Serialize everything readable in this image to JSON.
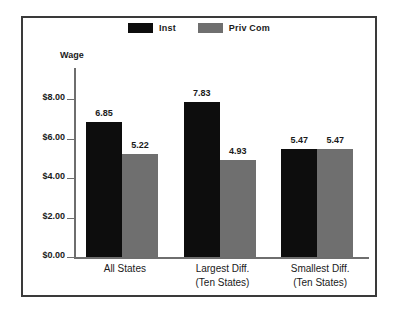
{
  "chart_data": {
    "type": "bar",
    "title": "",
    "xlabel": "",
    "ylabel": "Wage",
    "ylim": [
      0,
      8
    ],
    "grid": false,
    "legend_position": "top-center",
    "categories": [
      {
        "line1": "All States",
        "line2": ""
      },
      {
        "line1": "Largest Diff.",
        "line2": "(Ten States)"
      },
      {
        "line1": "Smallest Diff.",
        "line2": "(Ten States)"
      }
    ],
    "y_ticks": [
      "$0.00",
      "$2.00",
      "$4.00",
      "$6.00",
      "$8.00"
    ],
    "y_tick_values": [
      0,
      2,
      4,
      6,
      8
    ],
    "series": [
      {
        "name": "Inst",
        "color": "#0d0d0d",
        "values": [
          6.85,
          7.83,
          5.47
        ],
        "labels": [
          "6.85",
          "7.83",
          "5.47"
        ]
      },
      {
        "name": "Priv Com",
        "color": "#6f6f6f",
        "values": [
          5.22,
          4.93,
          5.47
        ],
        "labels": [
          "5.22",
          "4.93",
          "5.47"
        ]
      }
    ]
  }
}
